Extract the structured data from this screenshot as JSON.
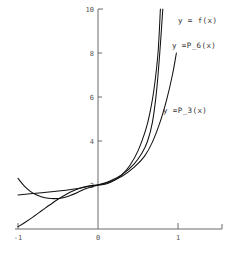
{
  "chart_data": {
    "type": "line",
    "title": "",
    "subtitle": "",
    "xlabel": "",
    "ylabel": "",
    "xlim": [
      -1.05,
      1.55
    ],
    "ylim": [
      0,
      10
    ],
    "grid": false,
    "legend_position": "inline-annotations",
    "x_ticks": [
      {
        "value": -1,
        "label": "-1"
      },
      {
        "value": 0,
        "label": "0"
      },
      {
        "value": 1,
        "label": "1"
      }
    ],
    "y_ticks": [
      {
        "value": 2,
        "label": "2"
      },
      {
        "value": 4,
        "label": "4"
      },
      {
        "value": 6,
        "label": "6"
      },
      {
        "value": 8,
        "label": "8"
      },
      {
        "value": 10,
        "label": "10"
      }
    ],
    "annotations": [
      {
        "text": "y = f(x)",
        "x_px": 178,
        "y_px": 23
      },
      {
        "text": "y =P_6(x)",
        "x_px": 172,
        "y_px": 48
      },
      {
        "text": "y =P_3(x)",
        "x_px": 163,
        "y_px": 113
      }
    ],
    "series": [
      {
        "name": "y = f(x)",
        "label": "y = f(x)",
        "color": "#111111",
        "x": [
          -1.0,
          -0.9,
          -0.8,
          -0.7,
          -0.6,
          -0.5,
          -0.4,
          -0.3,
          -0.2,
          -0.1,
          0.0,
          0.1,
          0.2,
          0.3,
          0.4,
          0.5,
          0.6,
          0.65,
          0.7,
          0.75,
          0.78
        ],
        "y": [
          0.1,
          0.33,
          0.58,
          0.84,
          1.1,
          1.35,
          1.57,
          1.75,
          1.89,
          1.97,
          2.0,
          2.05,
          2.2,
          2.47,
          2.9,
          3.55,
          4.55,
          5.3,
          6.35,
          8.0,
          10.0
        ]
      },
      {
        "name": "y =P_6(x)",
        "label": "y =P_6(x)",
        "color": "#111111",
        "x": [
          -1.0,
          -0.92,
          -0.85,
          -0.78,
          -0.7,
          -0.62,
          -0.55,
          -0.45,
          -0.35,
          -0.25,
          -0.15,
          0.0,
          0.15,
          0.3,
          0.45,
          0.55,
          0.62,
          0.68,
          0.73,
          0.77,
          0.81
        ],
        "y": [
          2.3,
          1.95,
          1.72,
          1.57,
          1.46,
          1.4,
          1.38,
          1.41,
          1.52,
          1.67,
          1.84,
          2.0,
          2.18,
          2.47,
          2.95,
          3.45,
          4.0,
          4.85,
          6.2,
          7.9,
          10.0
        ]
      },
      {
        "name": "y =P_3(x)",
        "label": "y =P_3(x)",
        "color": "#111111",
        "x": [
          -1.0,
          -0.85,
          -0.7,
          -0.55,
          -0.4,
          -0.25,
          -0.1,
          0.0,
          0.15,
          0.3,
          0.45,
          0.58,
          0.68,
          0.78,
          0.86,
          0.93,
          0.98
        ],
        "y": [
          1.55,
          1.6,
          1.65,
          1.7,
          1.76,
          1.84,
          1.95,
          2.0,
          2.15,
          2.4,
          2.8,
          3.3,
          3.95,
          4.9,
          5.9,
          7.0,
          8.0
        ]
      }
    ]
  },
  "axes": {
    "origin_px": {
      "x": 98,
      "y": 229
    },
    "x_scale_px_per_unit": 80,
    "y_scale_px_per_unit": 22,
    "x_axis_start_px": 15,
    "x_axis_end_px": 222,
    "y_axis_top_px": 9
  }
}
